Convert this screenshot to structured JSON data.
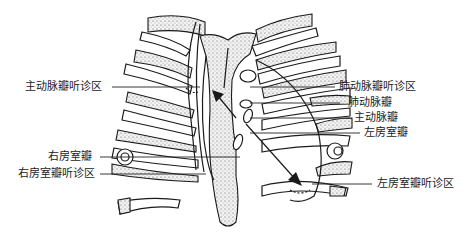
{
  "figure": {
    "labels": {
      "aortic_area": "主动脉瓣听诊区",
      "pulmonary_area": "肺动脉瓣听诊区",
      "pulmonary_valve": "肺动脉瓣",
      "aortic_valve": "主动脉瓣",
      "mitral_valve": "左房室瓣",
      "tricuspid_valve": "右房室瓣",
      "tricuspid_area": "右房室瓣听诊区",
      "mitral_area": "左房室瓣听诊区"
    },
    "colors": {
      "line": "#1a1a1a",
      "stipple": "#555555",
      "background": "#ffffff"
    }
  }
}
